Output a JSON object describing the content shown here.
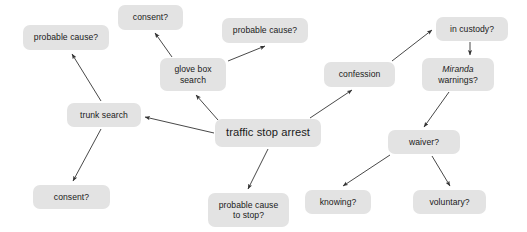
{
  "diagram": {
    "type": "node-link-diagram",
    "canvas": {
      "width": 527,
      "height": 232,
      "background": "#ffffff"
    },
    "style": {
      "node_fill": "#e3e3e3",
      "node_text": "#1a1a1a",
      "edge_color": "#333333"
    },
    "nodes": [
      {
        "id": "probable-cause-trunk",
        "label": "probable cause?",
        "x": 23,
        "y": 25,
        "w": 86,
        "h": 25,
        "lines": 1,
        "italic_lead": false,
        "center": false
      },
      {
        "id": "consent-glove-box",
        "label": "consent?",
        "x": 118,
        "y": 5,
        "w": 65,
        "h": 25,
        "lines": 1,
        "italic_lead": false,
        "center": false
      },
      {
        "id": "probable-cause-glove-box",
        "label": "probable cause?",
        "x": 222,
        "y": 18,
        "w": 86,
        "h": 25,
        "lines": 1,
        "italic_lead": false,
        "center": false
      },
      {
        "id": "glove-box-search",
        "label": "glove box\nsearch",
        "x": 160,
        "y": 58,
        "w": 66,
        "h": 33,
        "lines": 2,
        "italic_lead": false,
        "center": false
      },
      {
        "id": "trunk-search",
        "label": "trunk search",
        "x": 67,
        "y": 103,
        "w": 74,
        "h": 24,
        "lines": 1,
        "italic_lead": false,
        "center": false
      },
      {
        "id": "consent-trunk",
        "label": "consent?",
        "x": 33,
        "y": 185,
        "w": 77,
        "h": 24,
        "lines": 1,
        "italic_lead": false,
        "center": false
      },
      {
        "id": "traffic-stop-arrest",
        "label": "traffic stop arrest",
        "x": 215,
        "y": 119,
        "w": 106,
        "h": 28,
        "lines": 1,
        "italic_lead": false,
        "center": true
      },
      {
        "id": "probable-cause-to-stop",
        "label": "probable cause\nto stop?",
        "x": 208,
        "y": 193,
        "w": 81,
        "h": 34,
        "lines": 2,
        "italic_lead": false,
        "center": false
      },
      {
        "id": "confession",
        "label": "confession",
        "x": 324,
        "y": 62,
        "w": 71,
        "h": 25,
        "lines": 1,
        "italic_lead": false,
        "center": false
      },
      {
        "id": "in-custody",
        "label": "in custody?",
        "x": 436,
        "y": 17,
        "w": 72,
        "h": 24,
        "lines": 1,
        "italic_lead": false,
        "center": false
      },
      {
        "id": "miranda-warnings",
        "label_italic": "Miranda",
        "label_rest": "warnings?",
        "label": "Miranda\nwarnings?",
        "x": 422,
        "y": 58,
        "w": 72,
        "h": 33,
        "lines": 2,
        "italic_lead": true,
        "center": false
      },
      {
        "id": "waiver",
        "label": "waiver?",
        "x": 388,
        "y": 130,
        "w": 72,
        "h": 24,
        "lines": 1,
        "italic_lead": false,
        "center": false
      },
      {
        "id": "knowing",
        "label": "knowing?",
        "x": 305,
        "y": 190,
        "w": 66,
        "h": 24,
        "lines": 1,
        "italic_lead": false,
        "center": false
      },
      {
        "id": "voluntary",
        "label": "voluntary?",
        "x": 413,
        "y": 190,
        "w": 73,
        "h": 24,
        "lines": 1,
        "italic_lead": false,
        "center": false
      }
    ],
    "edges": [
      {
        "from": "traffic-stop-arrest",
        "to": "trunk-search",
        "x1": 214,
        "y1": 133,
        "x2": 145,
        "y2": 117
      },
      {
        "from": "traffic-stop-arrest",
        "to": "glove-box-search",
        "x1": 218,
        "y1": 120,
        "x2": 196,
        "y2": 95
      },
      {
        "from": "traffic-stop-arrest",
        "to": "confession",
        "x1": 310,
        "y1": 118,
        "x2": 352,
        "y2": 90
      },
      {
        "from": "traffic-stop-arrest",
        "to": "probable-cause-to-stop",
        "x1": 268,
        "y1": 149,
        "x2": 248,
        "y2": 189
      },
      {
        "from": "trunk-search",
        "to": "probable-cause-trunk",
        "x1": 101,
        "y1": 101,
        "x2": 72,
        "y2": 54
      },
      {
        "from": "trunk-search",
        "to": "consent-trunk",
        "x1": 101,
        "y1": 129,
        "x2": 73,
        "y2": 181
      },
      {
        "from": "glove-box-search",
        "to": "consent-glove-box",
        "x1": 172,
        "y1": 57,
        "x2": 155,
        "y2": 33
      },
      {
        "from": "glove-box-search",
        "to": "probable-cause-glove-box",
        "x1": 228,
        "y1": 61,
        "x2": 265,
        "y2": 46
      },
      {
        "from": "confession",
        "to": "in-custody",
        "x1": 392,
        "y1": 61,
        "x2": 432,
        "y2": 30
      },
      {
        "from": "in-custody",
        "to": "miranda-warnings",
        "x1": 470,
        "y1": 42,
        "x2": 470,
        "y2": 55
      },
      {
        "from": "miranda-warnings",
        "to": "waiver",
        "x1": 449,
        "y1": 92,
        "x2": 424,
        "y2": 127
      },
      {
        "from": "waiver",
        "to": "knowing",
        "x1": 390,
        "y1": 155,
        "x2": 343,
        "y2": 186
      },
      {
        "from": "waiver",
        "to": "voluntary",
        "x1": 432,
        "y1": 156,
        "x2": 450,
        "y2": 186
      }
    ]
  }
}
